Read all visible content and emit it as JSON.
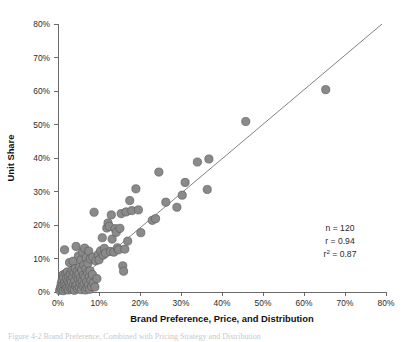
{
  "figure": {
    "background_color": "#ffffff",
    "marker_fill": "#8a8a8a",
    "marker_stroke": "#5e5e5e",
    "line_color": "#6b6b6b",
    "axis_color": "#5a5a5a"
  },
  "annotations": {
    "n_label": "n = 120",
    "r_label": "r  = 0.94",
    "r2_prefix": "r",
    "r2_sup": "2",
    "r2_value": "  = 0.87"
  },
  "chart_data": {
    "type": "scatter",
    "title": "",
    "xlabel": "Brand Preference, Price, and Distribution",
    "ylabel": "Unit Share",
    "xlim": [
      0,
      80
    ],
    "ylim": [
      0,
      80
    ],
    "xticks": [
      0,
      10,
      20,
      30,
      40,
      50,
      60,
      70,
      80
    ],
    "yticks": [
      0,
      10,
      20,
      30,
      40,
      50,
      60,
      70,
      80
    ],
    "xtick_labels": [
      "0%",
      "10%",
      "20%",
      "30%",
      "40%",
      "50%",
      "60%",
      "70%",
      "80%"
    ],
    "ytick_labels": [
      "0%",
      "10%",
      "20%",
      "30%",
      "40%",
      "50%",
      "60%",
      "70%",
      "80%"
    ],
    "grid": false,
    "legend": "none",
    "n": 120,
    "r": 0.94,
    "r_squared": 0.87,
    "trendline": {
      "type": "linear",
      "x_start": 0.0,
      "y_start": -1.5,
      "x_end": 80.0,
      "y_end": 81.0
    },
    "points": [
      [
        0.4,
        0.5
      ],
      [
        0.6,
        1.4
      ],
      [
        0.8,
        2.6
      ],
      [
        0.9,
        0.8
      ],
      [
        1.0,
        3.6
      ],
      [
        1.1,
        1.9
      ],
      [
        1.2,
        5.1
      ],
      [
        1.3,
        0.4
      ],
      [
        1.4,
        4.3
      ],
      [
        1.5,
        2.2
      ],
      [
        1.6,
        12.6
      ],
      [
        1.7,
        3.1
      ],
      [
        1.8,
        0.9
      ],
      [
        1.9,
        5.6
      ],
      [
        2.0,
        2.0
      ],
      [
        2.1,
        4.0
      ],
      [
        2.2,
        1.2
      ],
      [
        2.3,
        6.0
      ],
      [
        2.4,
        3.3
      ],
      [
        2.5,
        0.6
      ],
      [
        2.6,
        4.8
      ],
      [
        2.7,
        2.5
      ],
      [
        2.8,
        8.8
      ],
      [
        2.9,
        1.6
      ],
      [
        3.0,
        5.3
      ],
      [
        3.1,
        3.7
      ],
      [
        3.2,
        0.8
      ],
      [
        3.3,
        2.9
      ],
      [
        3.4,
        6.4
      ],
      [
        3.5,
        1.1
      ],
      [
        3.6,
        4.5
      ],
      [
        3.7,
        9.2
      ],
      [
        3.8,
        2.3
      ],
      [
        3.9,
        5.9
      ],
      [
        4.0,
        0.5
      ],
      [
        4.1,
        3.4
      ],
      [
        4.2,
        7.0
      ],
      [
        4.3,
        1.8
      ],
      [
        4.4,
        13.6
      ],
      [
        4.5,
        4.9
      ],
      [
        4.6,
        2.1
      ],
      [
        4.7,
        6.2
      ],
      [
        4.8,
        0.9
      ],
      [
        4.9,
        3.9
      ],
      [
        5.0,
        10.8
      ],
      [
        5.1,
        5.4
      ],
      [
        5.2,
        1.4
      ],
      [
        5.3,
        7.4
      ],
      [
        5.4,
        2.8
      ],
      [
        5.5,
        4.2
      ],
      [
        5.6,
        9.6
      ],
      [
        5.7,
        0.7
      ],
      [
        5.8,
        6.6
      ],
      [
        5.9,
        3.2
      ],
      [
        6.0,
        11.9
      ],
      [
        6.1,
        1.9
      ],
      [
        6.2,
        5.0
      ],
      [
        6.3,
        8.1
      ],
      [
        6.4,
        2.5
      ],
      [
        6.5,
        13.1
      ],
      [
        6.6,
        4.4
      ],
      [
        6.7,
        0.6
      ],
      [
        6.8,
        6.9
      ],
      [
        6.9,
        10.3
      ],
      [
        7.0,
        3.0
      ],
      [
        7.1,
        1.3
      ],
      [
        7.2,
        5.7
      ],
      [
        7.3,
        8.5
      ],
      [
        7.4,
        2.2
      ],
      [
        7.5,
        12.2
      ],
      [
        7.6,
        4.6
      ],
      [
        7.7,
        0.8
      ],
      [
        7.8,
        6.3
      ],
      [
        7.9,
        9.9
      ],
      [
        8.0,
        3.5
      ],
      [
        8.2,
        1.6
      ],
      [
        8.4,
        5.2
      ],
      [
        8.5,
        10.4
      ],
      [
        8.6,
        2.7
      ],
      [
        8.8,
        23.8
      ],
      [
        9.0,
        1.5
      ],
      [
        9.2,
        9.3
      ],
      [
        9.5,
        4.0
      ],
      [
        9.8,
        11.2
      ],
      [
        10.0,
        9.6
      ],
      [
        10.4,
        12.3
      ],
      [
        10.8,
        16.2
      ],
      [
        11.0,
        11.0
      ],
      [
        11.3,
        13.0
      ],
      [
        11.6,
        11.6
      ],
      [
        11.9,
        19.1
      ],
      [
        12.2,
        20.6
      ],
      [
        12.5,
        19.6
      ],
      [
        12.8,
        12.1
      ],
      [
        13.0,
        23.0
      ],
      [
        13.2,
        15.8
      ],
      [
        13.6,
        11.9
      ],
      [
        13.9,
        18.9
      ],
      [
        14.2,
        17.8
      ],
      [
        14.5,
        13.2
      ],
      [
        14.8,
        12.6
      ],
      [
        15.1,
        19.0
      ],
      [
        15.4,
        23.4
      ],
      [
        15.8,
        7.8
      ],
      [
        16.0,
        6.2
      ],
      [
        16.3,
        12.8
      ],
      [
        16.6,
        23.9
      ],
      [
        17.0,
        15.2
      ],
      [
        17.5,
        27.3
      ],
      [
        18.0,
        24.3
      ],
      [
        19.0,
        30.8
      ],
      [
        19.6,
        24.5
      ],
      [
        20.2,
        17.7
      ],
      [
        23.0,
        21.4
      ],
      [
        23.8,
        21.9
      ],
      [
        24.6,
        35.8
      ],
      [
        26.3,
        26.8
      ],
      [
        29.0,
        25.3
      ],
      [
        30.3,
        28.9
      ],
      [
        31.0,
        32.7
      ],
      [
        34.0,
        38.8
      ],
      [
        36.4,
        30.6
      ],
      [
        36.8,
        39.7
      ],
      [
        45.8,
        50.9
      ],
      [
        65.3,
        60.4
      ]
    ]
  },
  "caption": {
    "text": "Figure 4-2  Brand Preference, Combined with Pricing Strategy and Distribution"
  }
}
